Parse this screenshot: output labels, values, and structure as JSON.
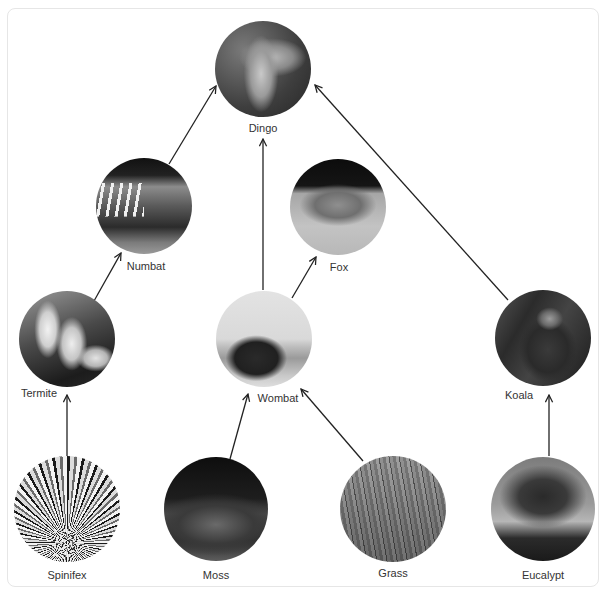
{
  "diagram": {
    "type": "food-web",
    "nodes": [
      {
        "id": "dingo",
        "label": "Dingo",
        "icon": "dingo-photo",
        "cx": 263,
        "cy": 69,
        "r": 48,
        "label_x": 263,
        "label_y": 122
      },
      {
        "id": "numbat",
        "label": "Numbat",
        "icon": "numbat-photo",
        "cx": 144,
        "cy": 206,
        "r": 48,
        "label_x": 146,
        "label_y": 260
      },
      {
        "id": "fox",
        "label": "Fox",
        "icon": "fox-photo",
        "cx": 338,
        "cy": 207,
        "r": 48,
        "label_x": 339,
        "label_y": 261
      },
      {
        "id": "termite",
        "label": "Termite",
        "icon": "termite-photo",
        "cx": 67,
        "cy": 339,
        "r": 48,
        "label_x": 39,
        "label_y": 387
      },
      {
        "id": "wombat",
        "label": "Wombat",
        "icon": "wombat-photo",
        "cx": 264,
        "cy": 339,
        "r": 48,
        "label_x": 278,
        "label_y": 392
      },
      {
        "id": "koala",
        "label": "Koala",
        "icon": "koala-photo",
        "cx": 543,
        "cy": 338,
        "r": 48,
        "label_x": 519,
        "label_y": 389
      },
      {
        "id": "spinifex",
        "label": "Spinifex",
        "icon": "spinifex-photo",
        "cx": 67,
        "cy": 509,
        "r": 53,
        "label_x": 67,
        "label_y": 569
      },
      {
        "id": "moss",
        "label": "Moss",
        "icon": "moss-photo",
        "cx": 216,
        "cy": 509,
        "r": 52,
        "label_x": 216,
        "label_y": 569
      },
      {
        "id": "grass",
        "label": "Grass",
        "icon": "grass-photo",
        "cx": 393,
        "cy": 509,
        "r": 53,
        "label_x": 393,
        "label_y": 567
      },
      {
        "id": "eucalypt",
        "label": "Eucalypt",
        "icon": "eucalypt-photo",
        "cx": 543,
        "cy": 509,
        "r": 52,
        "label_x": 543,
        "label_y": 569
      }
    ],
    "edges": [
      {
        "from": "numbat",
        "to": "dingo",
        "x1": 169,
        "y1": 164,
        "x2": 216,
        "y2": 86
      },
      {
        "from": "wombat",
        "to": "dingo",
        "x1": 263,
        "y1": 290,
        "x2": 263,
        "y2": 139
      },
      {
        "from": "koala",
        "to": "dingo",
        "x1": 508,
        "y1": 300,
        "x2": 315,
        "y2": 85
      },
      {
        "from": "wombat",
        "to": "fox",
        "x1": 292,
        "y1": 298,
        "x2": 316,
        "y2": 257
      },
      {
        "from": "termite",
        "to": "numbat",
        "x1": 94,
        "y1": 301,
        "x2": 121,
        "y2": 253
      },
      {
        "from": "spinifex",
        "to": "termite",
        "x1": 67,
        "y1": 456,
        "x2": 67,
        "y2": 395
      },
      {
        "from": "moss",
        "to": "wombat",
        "x1": 230,
        "y1": 459,
        "x2": 248,
        "y2": 394
      },
      {
        "from": "grass",
        "to": "wombat",
        "x1": 363,
        "y1": 461,
        "x2": 301,
        "y2": 389
      },
      {
        "from": "eucalypt",
        "to": "koala",
        "x1": 549,
        "y1": 456,
        "x2": 549,
        "y2": 395
      }
    ],
    "colors": {
      "edge": "#222222",
      "label": "#333333",
      "frame_border": "#e6e6e6"
    }
  }
}
